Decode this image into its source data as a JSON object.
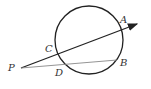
{
  "diagram": {
    "circle": {
      "cx": 89,
      "cy": 40,
      "r": 34
    },
    "points": {
      "P": {
        "label": "P",
        "x": 21,
        "y": 68
      },
      "A": {
        "label": "A",
        "x": 120,
        "y": 31
      },
      "B": {
        "label": "B",
        "x": 118,
        "y": 60
      },
      "C": {
        "label": "C",
        "x": 57,
        "y": 53
      },
      "D": {
        "label": "D",
        "x": 62,
        "y": 64
      }
    },
    "labels": {
      "P": "P",
      "A": "A",
      "B": "B",
      "C": "C",
      "D": "D"
    },
    "colors": {
      "stroke": "#222222",
      "secant_light": "#888888"
    }
  }
}
